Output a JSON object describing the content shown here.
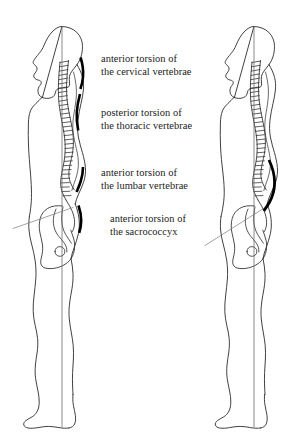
{
  "figure": {
    "background_color": "#ffffff",
    "outline_color": "#2b2b2b",
    "marker_color": "#000000",
    "plumb_line_color": "#555555",
    "leader_line_color": "#6a6a6a",
    "width": 301,
    "height": 447
  },
  "annotations": [
    {
      "id": "cervical",
      "name": "anterior-torsion-cervical",
      "line1": "anterior torsion of",
      "line2": "the cervical vertebrae",
      "region": "cervical vertebrae",
      "direction": "anterior"
    },
    {
      "id": "thoracic",
      "name": "posterior-torsion-thoracic",
      "line1": "posterior torsion of",
      "line2": "the thoracic vertebrae",
      "region": "thoracic vertebrae",
      "direction": "posterior"
    },
    {
      "id": "lumbar",
      "name": "anterior-torsion-lumbar",
      "line1": "anterior torsion of",
      "line2": "the lumbar vertebrae",
      "region": "lumbar vertebrae",
      "direction": "anterior"
    },
    {
      "id": "sacrococcyx",
      "name": "anterior-torsion-sacrococcyx",
      "line1": "anterior torsion of",
      "line2": "the sacrococcyx",
      "region": "sacrococcyx",
      "direction": "anterior"
    }
  ],
  "figures": [
    {
      "id": "left-figure",
      "name": "left-body-lateral-view",
      "position": "left",
      "description": "Lateral view of human body with spinal column, pelvis and plumb line",
      "markers": 4
    },
    {
      "id": "right-figure",
      "name": "right-body-lateral-view",
      "position": "right",
      "description": "Lateral view of human body with spinal column, pelvis and plumb line",
      "markers": 1
    }
  ]
}
